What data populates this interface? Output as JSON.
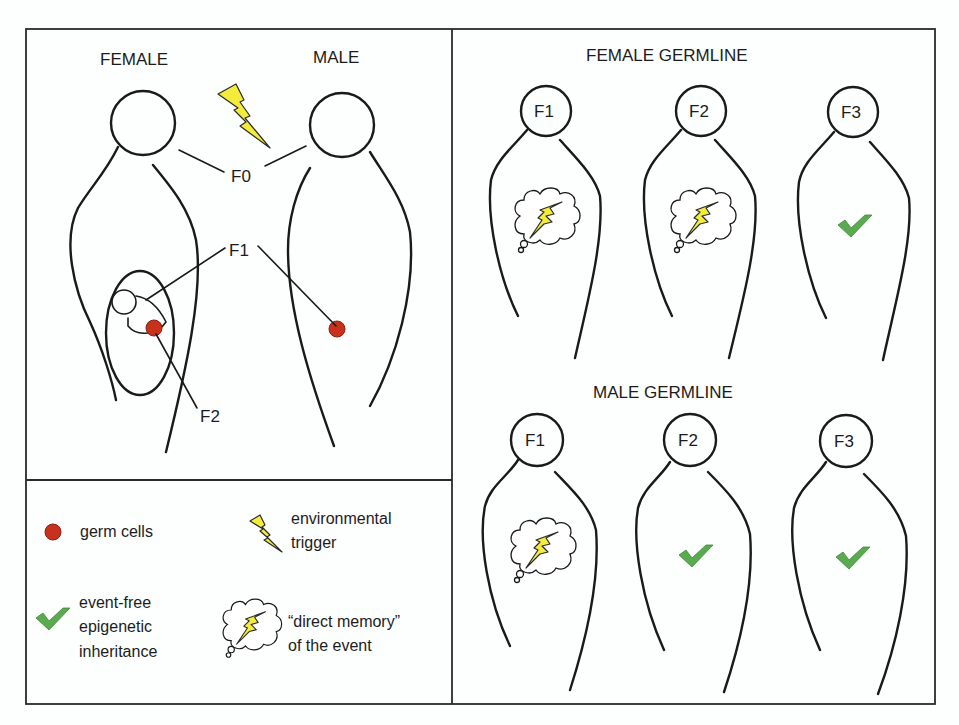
{
  "figure": {
    "left_panel": {
      "female_label": "FEMALE",
      "male_label": "MALE",
      "f0_label": "F0",
      "f1_label": "F1",
      "f2_label": "F2"
    },
    "legend": {
      "germ_cells": "germ cells",
      "environmental_trigger": [
        "environmental",
        "trigger"
      ],
      "event_free": [
        "event-free",
        "epigenetic",
        "inheritance"
      ],
      "direct_memory": [
        "“direct memory”",
        "of the event"
      ]
    },
    "female_germline": {
      "title": "FEMALE GERMLINE",
      "generations": [
        {
          "label": "F1",
          "marker": "direct-memory"
        },
        {
          "label": "F2",
          "marker": "direct-memory"
        },
        {
          "label": "F3",
          "marker": "event-free"
        }
      ]
    },
    "male_germline": {
      "title": "MALE GERMLINE",
      "generations": [
        {
          "label": "F1",
          "marker": "direct-memory"
        },
        {
          "label": "F2",
          "marker": "event-free"
        },
        {
          "label": "F3",
          "marker": "event-free"
        }
      ]
    },
    "colors": {
      "bolt": "#f3ec3a",
      "germ_cell": "#c8321c",
      "check": "#5aaa4f",
      "line": "#1a1a1a"
    }
  }
}
